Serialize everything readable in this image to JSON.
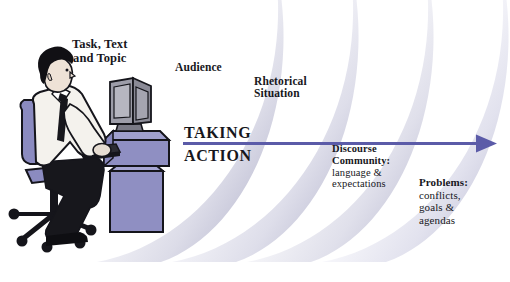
{
  "figure": {
    "background_color": "#ffffff"
  },
  "arcs": {
    "count": 4,
    "edge_color": "#b9b9d0",
    "fill_color": "#ffffff",
    "description": "four nested concentric arcs fading from lavender-grey to white"
  },
  "arrow": {
    "label_line1": "TAKING",
    "label_line2": "ACTION",
    "color": "#5b5ba8",
    "direction": "left-to-right"
  },
  "labels": {
    "task": "Task, Text\nand Topic",
    "audience": "Audience",
    "rhetorical": "Rhetorical\nSituation",
    "discourse_head": "Discourse\nCommunity:",
    "discourse_sub": "language &\nexpectations",
    "problems_head": "Problems:",
    "problems_sub": "conflicts,\ngoals &\nagendas"
  },
  "illustration": {
    "name": "person-at-computer",
    "person_shirt_color": "#f3f1ec",
    "person_hair_color": "#111014",
    "person_tie_color": "#17171c",
    "person_trousers_color": "#17171c",
    "chair_color": "#8b8bc0",
    "desk_color": "#8b8bc0",
    "monitor_color": "#9a9aa6"
  }
}
